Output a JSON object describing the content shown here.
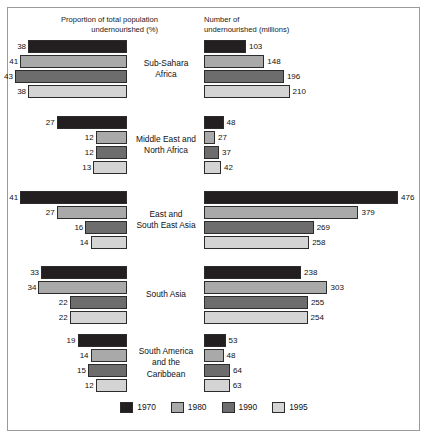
{
  "figure": {
    "header_left": "Proportion of total population\nundernourished (%)",
    "header_right": "Number of\nundernourished (millions)"
  },
  "legend": {
    "items": [
      {
        "label": "1970",
        "color": "#231f20"
      },
      {
        "label": "1980",
        "color": "#a9a9a9"
      },
      {
        "label": "1990",
        "color": "#6d6d6d"
      },
      {
        "label": "1995",
        "color": "#d4d4d4"
      }
    ]
  },
  "chart_data": {
    "type": "bar",
    "title": "",
    "orientation": "horizontal",
    "grid": false,
    "legend_position": "bottom",
    "panels": [
      {
        "name": "proportion",
        "title": "Proportion of total population undernourished (%)",
        "xlabel": "Proportion of total population undernourished (%)",
        "ylabel": "",
        "unit": "%",
        "direction": "right-to-left",
        "xlim": [
          0,
          43
        ]
      },
      {
        "name": "number",
        "title": "Number of undernourished (millions)",
        "xlabel": "Number of undernourished (millions)",
        "ylabel": "",
        "unit": "millions",
        "direction": "left-to-right",
        "xlim": [
          0,
          476
        ]
      }
    ],
    "categories": [
      "Sub-Sahara Africa",
      "Middle East and North Africa",
      "East and South East Asia",
      "South Asia",
      "South America and the Caribbean"
    ],
    "series": [
      {
        "name": "1970",
        "color": "#231f20"
      },
      {
        "name": "1980",
        "color": "#a9a9a9"
      },
      {
        "name": "1990",
        "color": "#6d6d6d"
      },
      {
        "name": "1995",
        "color": "#d4d4d4"
      }
    ],
    "groups": [
      {
        "region": "Sub-Sahara\nAfrica",
        "region_plain": "Sub-Sahara Africa",
        "proportion": [
          38,
          41,
          43,
          38
        ],
        "number": [
          103,
          148,
          196,
          210
        ]
      },
      {
        "region": "Middle East and\nNorth Africa",
        "region_plain": "Middle East and North Africa",
        "proportion": [
          27,
          12,
          12,
          13
        ],
        "number": [
          48,
          27,
          37,
          42
        ]
      },
      {
        "region": "East and\nSouth East Asia",
        "region_plain": "East and South East Asia",
        "proportion": [
          41,
          27,
          16,
          14
        ],
        "number": [
          476,
          379,
          269,
          258
        ]
      },
      {
        "region": "South Asia",
        "region_plain": "South Asia",
        "proportion": [
          33,
          34,
          22,
          22
        ],
        "number": [
          238,
          303,
          255,
          254
        ]
      },
      {
        "region": "South America\nand the\nCaribbean",
        "region_plain": "South America and the Caribbean",
        "proportion": [
          19,
          14,
          15,
          12
        ],
        "number": [
          53,
          48,
          64,
          63
        ]
      }
    ]
  }
}
